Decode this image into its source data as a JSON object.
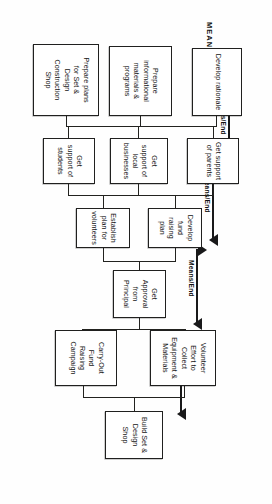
{
  "diagram": {
    "title": "MEANS",
    "orientation_note": "rotated",
    "nodes": [
      {
        "id": "develop-rationale",
        "lines": [
          "Develop rationale"
        ]
      },
      {
        "id": "prepare-informational",
        "lines": [
          "Prepare",
          "informational",
          "materials &",
          "programs"
        ]
      },
      {
        "id": "prepare-plans-set",
        "lines": [
          "Prepare plans",
          "for Set &",
          "Design",
          "Construction",
          "Shop"
        ]
      },
      {
        "id": "support-parents",
        "lines": [
          "Get support",
          "of parents"
        ]
      },
      {
        "id": "support-local-business",
        "lines": [
          "Get",
          "support of",
          "local",
          "businesses"
        ]
      },
      {
        "id": "support-students",
        "lines": [
          "Get",
          "support of",
          "students"
        ]
      },
      {
        "id": "fund-raising-plan",
        "lines": [
          "Develop",
          "fund raising",
          "plan"
        ]
      },
      {
        "id": "volunteer-plan",
        "lines": [
          "Establish",
          "plan for",
          "volunteers"
        ]
      },
      {
        "id": "approval-principal",
        "lines": [
          "Get",
          "Approval",
          "from",
          "Principal"
        ]
      },
      {
        "id": "volunteer-effort",
        "lines": [
          "Volunteer",
          "Effort to",
          "Collect",
          "Equipment &",
          "Materials"
        ]
      },
      {
        "id": "fund-raising-campaign",
        "lines": [
          "Carry-Out",
          "Fund",
          "Raising",
          "Campaign"
        ]
      },
      {
        "id": "build-set-design-shop",
        "lines": [
          "Build Set &",
          "Design Shop"
        ]
      }
    ],
    "means_end_markers": [
      {
        "id": "means-end-1",
        "label": "Means/End"
      },
      {
        "id": "means-end-2",
        "label": "Means/End"
      },
      {
        "id": "means-end-3",
        "label": "Means/End"
      },
      {
        "id": "means-end-4",
        "label": "Means/End"
      }
    ]
  }
}
